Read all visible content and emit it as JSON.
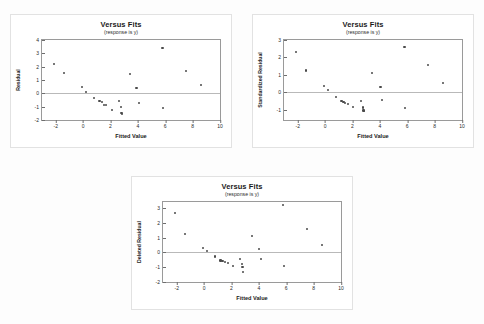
{
  "document": {
    "background_color": "#fdfdfd",
    "panel_border_color": "#e2e2e2",
    "axis_color": "#9a9a9a",
    "point_color": "#4a4a4a",
    "zero_line_color": "#b9b9b9"
  },
  "chart_data": [
    {
      "type": "scatter",
      "id": "versus-fits-residual",
      "title": "Versus Fits",
      "subtitle": "(response is y)",
      "xlabel": "Fitted Value",
      "ylabel": "Residual",
      "xlim": [
        -3,
        10
      ],
      "ylim": [
        -2,
        4
      ],
      "xticks": [
        -2,
        0,
        2,
        4,
        6,
        8,
        10
      ],
      "yticks": [
        4,
        3,
        2,
        1,
        0,
        -1,
        -2
      ],
      "grid": false,
      "legend": "none",
      "reference_line_y": 0,
      "x": [
        -2.1,
        -1.4,
        -0.1,
        0.2,
        0.8,
        1.2,
        1.4,
        1.5,
        1.7,
        2.1,
        2.6,
        2.75,
        2.8,
        2.85,
        3.4,
        3.9,
        4.1,
        5.8,
        5.85,
        7.5,
        8.6
      ],
      "y": [
        2.2,
        1.55,
        0.45,
        0.1,
        -0.35,
        -0.6,
        -0.62,
        -0.85,
        -0.9,
        -1.25,
        -0.6,
        -1.0,
        -1.45,
        -1.55,
        1.45,
        0.4,
        -0.7,
        3.4,
        -1.1,
        1.7,
        0.6
      ]
    },
    {
      "type": "scatter",
      "id": "versus-fits-standardized-residual",
      "title": "Versus Fits",
      "subtitle": "(response is y)",
      "xlabel": "Fitted Value",
      "ylabel": "Standardized Residual",
      "xlim": [
        -3,
        10
      ],
      "ylim": [
        -1.6,
        3
      ],
      "xticks": [
        -2,
        0,
        2,
        4,
        6,
        8,
        10
      ],
      "yticks": [
        3,
        2,
        1,
        0,
        -1
      ],
      "grid": false,
      "legend": "none",
      "reference_line_y": 0,
      "x": [
        -2.1,
        -1.4,
        -0.1,
        0.2,
        0.8,
        1.2,
        1.35,
        1.45,
        1.7,
        2.05,
        2.6,
        2.75,
        2.8,
        2.85,
        3.45,
        4.05,
        4.15,
        5.8,
        5.85,
        7.5,
        8.6
      ],
      "y": [
        2.3,
        1.25,
        0.35,
        0.12,
        -0.3,
        -0.52,
        -0.55,
        -0.62,
        -0.68,
        -0.85,
        -0.5,
        -0.88,
        -1.05,
        -1.1,
        1.1,
        0.3,
        -0.45,
        2.6,
        -0.9,
        1.55,
        0.55
      ]
    },
    {
      "type": "scatter",
      "id": "versus-fits-deleted-residual",
      "title": "Versus Fits",
      "subtitle": "(response is y)",
      "xlabel": "Fitted Value",
      "ylabel": "Deleted Residual",
      "xlim": [
        -3,
        10
      ],
      "ylim": [
        -2,
        3.4
      ],
      "xticks": [
        -2,
        0,
        2,
        4,
        6,
        8,
        10
      ],
      "yticks": [
        3,
        2,
        1,
        0,
        -1,
        -2
      ],
      "grid": false,
      "legend": "none",
      "reference_line_y": 0,
      "x": [
        -2.1,
        -1.4,
        -0.1,
        0.2,
        0.8,
        1.2,
        1.35,
        1.5,
        1.75,
        2.1,
        2.65,
        2.75,
        2.8,
        2.85,
        3.5,
        4.0,
        4.15,
        5.75,
        5.85,
        7.5,
        8.6
      ],
      "y": [
        2.65,
        1.25,
        0.32,
        0.1,
        -0.28,
        -0.55,
        -0.58,
        -0.65,
        -0.7,
        -0.92,
        -0.45,
        -0.8,
        -1.0,
        -1.3,
        1.1,
        0.25,
        -0.45,
        3.2,
        -0.9,
        1.6,
        0.52
      ]
    }
  ]
}
